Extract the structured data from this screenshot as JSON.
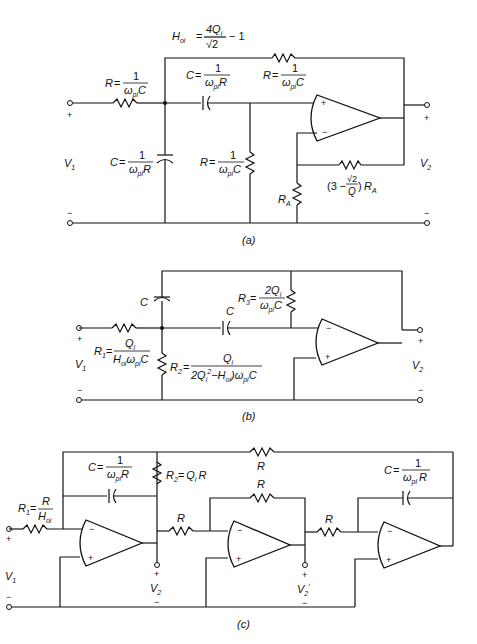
{
  "figure": {
    "panels": [
      {
        "id": "a",
        "caption": "(a)",
        "top_expr": {
          "lhs": "H",
          "lhs_sub": "oi",
          "eq": "=",
          "num": "4Q",
          "num_sub": "i",
          "den": "√2",
          "tail": "− 1"
        },
        "components": {
          "r_input": {
            "lhs": "R",
            "num": "1",
            "den": "ω",
            "den_sub": "pi",
            "den_tail": "C"
          },
          "c_series": {
            "lhs": "C",
            "num": "1",
            "den": "ω",
            "den_sub": "pi",
            "den_tail": "R"
          },
          "r_feedback": {
            "lhs": "R",
            "num": "1",
            "den": "ω",
            "den_sub": "pi",
            "den_tail": "C"
          },
          "c_shunt": {
            "lhs": "C",
            "num": "1",
            "den": "ω",
            "den_sub": "pi",
            "den_tail": "R"
          },
          "r_shunt": {
            "lhs": "R",
            "num": "1",
            "den": "ω",
            "den_sub": "pi",
            "den_tail": "C"
          },
          "r_a": {
            "label": "R",
            "sub": "A"
          },
          "r_gain": {
            "prefix": "(3 −",
            "num": "√2",
            "den": "Q",
            "suffix": ")",
            "tail": "R",
            "tail_sub": "A"
          }
        },
        "ports": {
          "v_in": "V",
          "v_in_sub": "1",
          "v_out": "V",
          "v_out_sub": "2",
          "plus": "+",
          "minus": "−"
        },
        "opamp": {
          "noninv": "+",
          "inv": "−"
        }
      },
      {
        "id": "b",
        "caption": "(b)",
        "components": {
          "c_top": {
            "label": "C"
          },
          "c_series": {
            "label": "C"
          },
          "r1": {
            "lhs": "R",
            "lhs_sub": "1",
            "num": "Q",
            "num_sub": "i",
            "den": "H",
            "den_sub": "oi",
            "den_tail": "ω",
            "den_tail_sub": "pi",
            "den_end": "C"
          },
          "r2": {
            "lhs": "R",
            "lhs_sub": "2",
            "num": "Q",
            "num_sub": "i",
            "den": "2Q",
            "den_sub": "i",
            "den_sup": "2",
            "den_mid": "−H",
            "den_mid_sub": "oi",
            "den_end": ")ω",
            "den_end_sub": "pi",
            "den_last": "C",
            "den_open": "("
          },
          "r3": {
            "lhs": "R",
            "lhs_sub": "3",
            "num": "2Q",
            "num_sub": "i",
            "den": "ω",
            "den_sub": "pi",
            "den_tail": "C"
          }
        },
        "ports": {
          "v_in": "V",
          "v_in_sub": "1",
          "v_out": "V",
          "v_out_sub": "2",
          "plus": "+",
          "minus": "−"
        },
        "opamp": {
          "noninv": "+",
          "inv": "−"
        }
      },
      {
        "id": "c",
        "caption": "(c)",
        "components": {
          "r1": {
            "lhs": "R",
            "lhs_sub": "1",
            "num": "R",
            "den": "H",
            "den_sub": "oi"
          },
          "c1": {
            "lhs": "C",
            "num": "1",
            "den": "ω",
            "den_sub": "pi",
            "den_tail": "R"
          },
          "r2": {
            "lhs": "R",
            "lhs_sub": "2",
            "eq": "=",
            "rhs": "Q",
            "rhs_sub": "i",
            "rhs_tail": "R"
          },
          "r_top": {
            "label": "R"
          },
          "r_mid_in": {
            "label": "R"
          },
          "r_mid_fb": {
            "label": "R"
          },
          "r_right_in": {
            "label": "R"
          },
          "c2": {
            "lhs": "C",
            "num": "1",
            "den": "ω",
            "den_sub": "pi",
            "den_tail": "R"
          }
        },
        "ports": {
          "v_in": "V",
          "v_in_sub": "1",
          "v_out": "V",
          "v_out_sub": "2",
          "v_out2": "V",
          "v_out2_sub": "2",
          "v_out2_prime": "′",
          "plus": "+",
          "minus": "−"
        },
        "opamp": {
          "noninv": "+",
          "inv": "−"
        }
      }
    ]
  }
}
